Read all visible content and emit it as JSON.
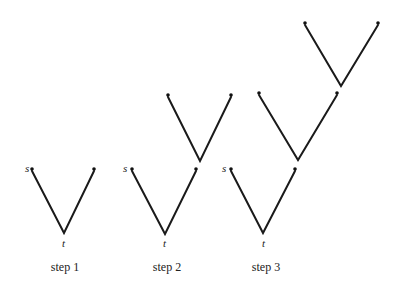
{
  "diagram": {
    "title": "",
    "panels": [
      {
        "label": "step 1",
        "source_label": "s",
        "sink_label": "t",
        "label_pos": [
          65,
          271
        ],
        "vs": [
          {
            "left": [
              32,
              169
            ],
            "right": [
              94,
              169
            ],
            "bottom": [
              64,
              233
            ]
          }
        ],
        "s_pos": [
          25,
          172
        ],
        "t_pos": [
          63,
          247
        ]
      },
      {
        "label": "step 2",
        "source_label": "s",
        "sink_label": "t",
        "label_pos": [
          167,
          271
        ],
        "vs": [
          {
            "left": [
              132,
              169
            ],
            "right": [
              196,
              169
            ],
            "bottom": [
              165,
              234
            ]
          },
          {
            "left": [
              168,
              95
            ],
            "right": [
              231,
              95
            ],
            "bottom": [
              200,
              161
            ]
          }
        ],
        "s_pos": [
          123,
          172
        ],
        "t_pos": [
          164,
          247
        ]
      },
      {
        "label": "step 3",
        "source_label": "s",
        "sink_label": "t",
        "label_pos": [
          266,
          271
        ],
        "vs": [
          {
            "left": [
              231,
              169
            ],
            "right": [
              295,
              169
            ],
            "bottom": [
              263,
              233
            ]
          },
          {
            "left": [
              259,
              93
            ],
            "right": [
              337,
              93
            ],
            "bottom": [
              298,
              160
            ]
          },
          {
            "left": [
              305,
              23
            ],
            "right": [
              378,
              23
            ],
            "bottom": [
              341,
              86
            ]
          }
        ],
        "s_pos": [
          222,
          172
        ],
        "t_pos": [
          263,
          247
        ]
      }
    ],
    "colors": {
      "line": "#1a1a1a",
      "dot": "#111111",
      "background": "#ffffff"
    }
  }
}
